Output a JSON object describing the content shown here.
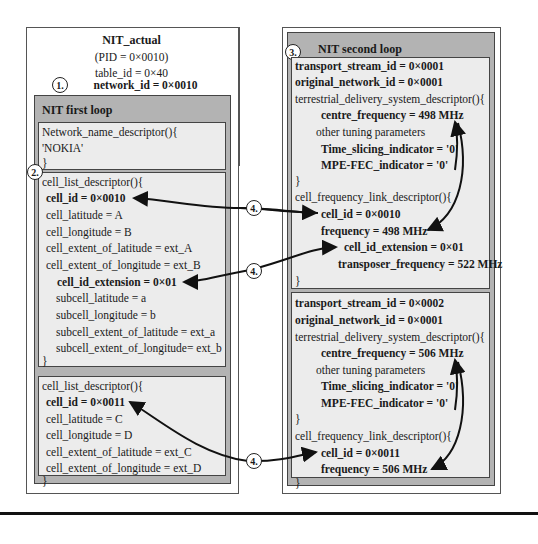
{
  "left": {
    "title": "NIT_actual",
    "pid": "(PID = 0×0010)",
    "table_id": "table_id = 0×40",
    "network_id": "network_id = 0×0010",
    "badge": "1.",
    "first_loop": {
      "title": "NIT first loop",
      "network_name": {
        "open": "Network_name_descriptor(){",
        "value": "'NOKIA'",
        "close": "}"
      },
      "cell_list_1": {
        "badge": "2.",
        "open": "cell_list_descriptor(){",
        "cell_id": "cell_id = 0×0010",
        "cell_latitude": "cell_latitude = A",
        "cell_longitude": "cell_longitude = B",
        "ext_lat": "cell_extent_of_latitude = ext_A",
        "ext_lon": "cell_extent_of_longitude = ext_B",
        "cell_id_extension": "cell_id_extension = 0×01",
        "subcell_latitude": "subcell_latitude = a",
        "subcell_longitude": "subcell_longitude = b",
        "subcell_ext_lat": "subcell_extent_of_latitude = ext_a",
        "subcell_ext_lon": "subcell_extent_of_longitude= ext_b",
        "close": "}"
      },
      "cell_list_2": {
        "open": "cell_list_descriptor(){",
        "cell_id": "cell_id = 0×0011",
        "cell_latitude": "cell_latitude = C",
        "cell_longitude": "cell_longitude = D",
        "ext_lat": "cell_extent_of_latitude = ext_C",
        "ext_lon": "cell_extent_of_longitude = ext_D",
        "close": "}"
      }
    }
  },
  "right": {
    "title": "NIT second loop",
    "badge": "3.",
    "ts1": {
      "transport_stream_id": "transport_stream_id = 0×0001",
      "original_network_id": "original_network_id = 0×0001",
      "tdsd_open": "terrestrial_delivery_system_descriptor(){",
      "centre_frequency": "centre_frequency = 498 MHz",
      "other": "other tuning parameters",
      "time_slicing": "Time_slicing_indicator = '0'",
      "mpe_fec": "MPE-FEC_indicator = '0'",
      "tdsd_close": "}",
      "cfld_open": "cell_frequency_link_descriptor(){",
      "cell_id": "cell_id = 0×0010",
      "frequency": "frequency = 498 MHz",
      "cell_id_extension": "cell_id_extension = 0×01",
      "transposer_frequency": "transposer_frequency = 522 MHz",
      "cfld_close": "}"
    },
    "ts2": {
      "transport_stream_id": "transport_stream_id = 0×0002",
      "original_network_id": "original_network_id = 0×0001",
      "tdsd_open": "terrestrial_delivery_system_descriptor(){",
      "centre_frequency": "centre_frequency = 506 MHz",
      "other": "other tuning parameters",
      "time_slicing": "Time_slicing_indicator = '0'",
      "mpe_fec": "MPE-FEC_indicator = '0'",
      "tdsd_close": "}",
      "cfld_open": "cell_frequency_link_descriptor(){",
      "cell_id": "cell_id = 0×0011",
      "frequency": "frequency = 506 MHz",
      "cfld_close": "}"
    }
  },
  "link_badges": [
    "4.",
    "4.",
    "4."
  ]
}
